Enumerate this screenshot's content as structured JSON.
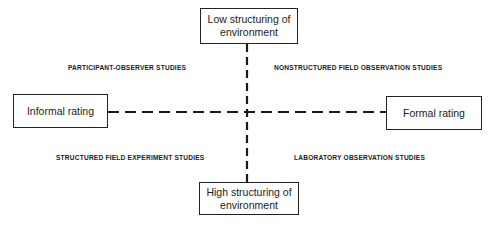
{
  "diagram": {
    "axes": {
      "vertical": {
        "top_label_line1": "Low structuring of",
        "top_label_line2": "environment",
        "bottom_label_line1": "High structuring of",
        "bottom_label_line2": "environment"
      },
      "horizontal": {
        "left_label": "Informal rating",
        "right_label": "Formal rating"
      }
    },
    "quadrants": {
      "top_left": "PARTICIPANT-OBSERVER STUDIES",
      "top_right": "NONSTRUCTURED FIELD OBSERVATION STUDIES",
      "bottom_left": "STRUCTURED FIELD EXPERIMENT STUDIES",
      "bottom_right": "LABORATORY OBSERVATION STUDIES"
    },
    "line_style": "dashed",
    "line_color": "#1a1a1a"
  }
}
